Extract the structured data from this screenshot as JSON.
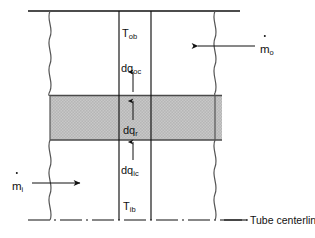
{
  "figure": {
    "background_color": "#ffffff",
    "line_color": "#111111",
    "band_fill_color": "#d9d9d9"
  },
  "labels": {
    "t_ob": {
      "base": "T",
      "sub": "ob",
      "name": "outer-bulk-temperature-label"
    },
    "t_ib": {
      "base": "T",
      "sub": "ib",
      "name": "inner-bulk-temperature-label"
    },
    "dq_oc": {
      "base": "dq",
      "sub": "oc",
      "name": "outer-convection-heat-label"
    },
    "dq_r": {
      "base": "dq",
      "sub": "r",
      "name": "radial-conduction-heat-label"
    },
    "dq_ic": {
      "base": "dq",
      "sub": "ic",
      "name": "inner-convection-heat-label"
    }
  },
  "flows": {
    "m_outer": {
      "base": "m",
      "sub": "o",
      "name": "outer-mass-flow-label",
      "direction": "left"
    },
    "m_inner": {
      "base": "m",
      "sub": "i",
      "name": "inner-mass-flow-label",
      "direction": "right"
    }
  },
  "annotations": {
    "centerline": "Tube centerline"
  },
  "geometry": {
    "top_rule_y": 11,
    "centerline_y": 220,
    "left_wavy_x": 50,
    "right_wavy_x": 215,
    "inner_wall_x": 119,
    "outer_wall_x": 151,
    "band_top_y": 95,
    "band_bottom_y": 140,
    "band_left_x": 50,
    "band_right_x": 222,
    "heat_arrow_x": 133
  }
}
